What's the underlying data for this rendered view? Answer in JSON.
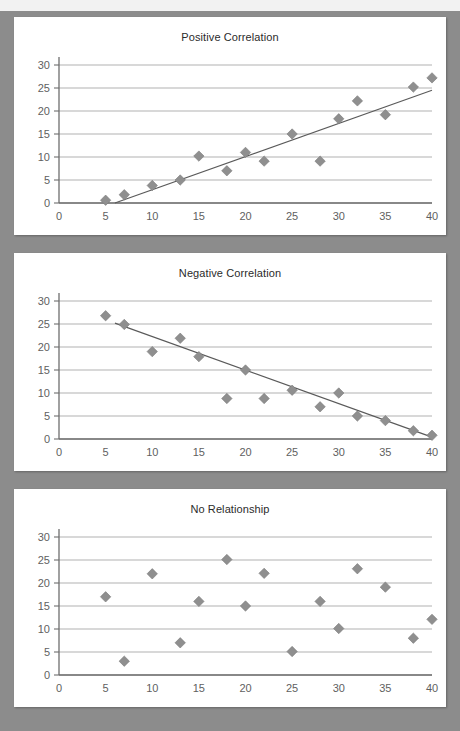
{
  "page": {
    "background_color": "#8c8c8c",
    "card_color": "#ffffff",
    "marker_color": "#8f8f8f",
    "gridline_color": "#a8a8a8",
    "axis_color": "#6e6e6e",
    "trendline_color": "#5a5a5a"
  },
  "chart_data": [
    {
      "type": "scatter",
      "title": "Positive Correlation",
      "xlabel": "",
      "ylabel": "",
      "xlim": [
        0,
        40
      ],
      "ylim": [
        0,
        30
      ],
      "xticks": [
        0,
        5,
        10,
        15,
        20,
        25,
        30,
        35,
        40
      ],
      "yticks": [
        0,
        5,
        10,
        15,
        20,
        25,
        30
      ],
      "grid": true,
      "legend": false,
      "x": [
        5,
        7,
        10,
        13,
        15,
        18,
        20,
        22,
        25,
        28,
        30,
        32,
        35,
        38,
        40
      ],
      "y": [
        0.6,
        1.8,
        3.8,
        5.0,
        10.2,
        7.0,
        11.0,
        9.1,
        15.0,
        9.1,
        18.3,
        22.2,
        19.2,
        25.2,
        27.2
      ],
      "trendline": {
        "x0": 6.0,
        "y0": 0.0,
        "x1": 40.0,
        "y1": 24.5
      }
    },
    {
      "type": "scatter",
      "title": "Negative Correlation",
      "xlabel": "",
      "ylabel": "",
      "xlim": [
        0,
        40
      ],
      "ylim": [
        0,
        30
      ],
      "xticks": [
        0,
        5,
        10,
        15,
        20,
        25,
        30,
        35,
        40
      ],
      "yticks": [
        0,
        5,
        10,
        15,
        20,
        25,
        30
      ],
      "grid": true,
      "legend": false,
      "x": [
        5,
        7,
        10,
        13,
        15,
        18,
        20,
        22,
        25,
        28,
        30,
        32,
        35,
        38,
        40
      ],
      "y": [
        26.8,
        24.9,
        19.0,
        21.9,
        17.9,
        8.8,
        15.0,
        8.8,
        10.6,
        7.0,
        10.0,
        5.0,
        4.0,
        1.8,
        0.8
      ],
      "trendline": {
        "x0": 6.0,
        "y0": 25.2,
        "x1": 40.0,
        "y1": 0.4
      }
    },
    {
      "type": "scatter",
      "title": "No Relationship",
      "xlabel": "",
      "ylabel": "",
      "xlim": [
        0,
        40
      ],
      "ylim": [
        0,
        30
      ],
      "xticks": [
        0,
        5,
        10,
        15,
        20,
        25,
        30,
        35,
        40
      ],
      "yticks": [
        0,
        5,
        10,
        15,
        20,
        25,
        30
      ],
      "grid": true,
      "legend": false,
      "x": [
        5,
        7,
        10,
        13,
        15,
        18,
        20,
        22,
        25,
        28,
        30,
        32,
        35,
        38,
        40
      ],
      "y": [
        17.0,
        3.0,
        22.0,
        7.0,
        16.0,
        25.1,
        15.0,
        22.1,
        5.1,
        16.0,
        10.1,
        23.1,
        19.1,
        8.0,
        12.1
      ],
      "trendline": null
    }
  ]
}
